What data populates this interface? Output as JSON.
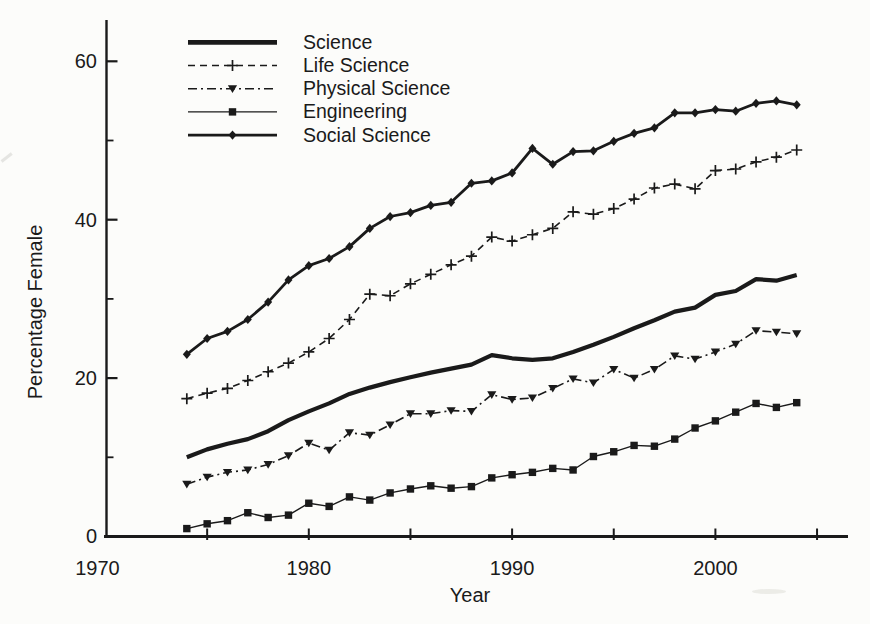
{
  "figure": {
    "background": "#fcfcfa",
    "ink_color": "#1a1a1a"
  },
  "chart_data": {
    "type": "line",
    "title": "",
    "xlabel": "Year",
    "ylabel": "Percentage Female",
    "x_range": [
      1970,
      2005
    ],
    "y_range": [
      0,
      65
    ],
    "x_major_ticks": [
      1970,
      1980,
      1990,
      2000
    ],
    "x_minor_ticks": [
      1975,
      1985,
      1995,
      2005
    ],
    "y_major_ticks": [
      0,
      20,
      40,
      60
    ],
    "y_minor_ticks": [
      10,
      30,
      50
    ],
    "grid": false,
    "legend_position": "upper-left-inside",
    "years": [
      1974,
      1975,
      1976,
      1977,
      1978,
      1979,
      1980,
      1981,
      1982,
      1983,
      1984,
      1985,
      1986,
      1987,
      1988,
      1989,
      1990,
      1991,
      1992,
      1993,
      1994,
      1995,
      1996,
      1997,
      1998,
      1999,
      2000,
      2001,
      2002,
      2003,
      2004
    ],
    "series": [
      {
        "name": "Science",
        "line": "solid-thick",
        "marker": "none",
        "values": [
          10,
          11,
          11.7,
          12.3,
          13.3,
          14.7,
          15.8,
          16.8,
          18,
          18.8,
          19.5,
          20.1,
          20.7,
          21.2,
          21.7,
          22.9,
          22.5,
          22.3,
          22.5,
          23.3,
          24.2,
          25.2,
          26.3,
          27.3,
          28.4,
          28.9,
          30.5,
          31,
          32.5,
          32.3,
          33
        ]
      },
      {
        "name": "Life Science",
        "line": "dashed",
        "marker": "plus",
        "values": [
          17.4,
          18.1,
          18.7,
          19.7,
          20.8,
          21.9,
          23.3,
          25,
          27.4,
          30.6,
          30.4,
          31.9,
          33.1,
          34.3,
          35.4,
          37.8,
          37.3,
          38.1,
          38.9,
          41,
          40.7,
          41.4,
          42.6,
          44,
          44.5,
          43.9,
          46.2,
          46.4,
          47.3,
          47.9,
          48.8
        ]
      },
      {
        "name": "Physical Science",
        "line": "dashdot",
        "marker": "triangle-down",
        "values": [
          6.6,
          7.5,
          8.1,
          8.4,
          9.1,
          10.2,
          11.8,
          10.9,
          13.1,
          12.8,
          14.1,
          15.5,
          15.5,
          15.9,
          15.8,
          17.9,
          17.3,
          17.5,
          18.7,
          19.9,
          19.4,
          21.1,
          20,
          21.1,
          22.8,
          22.4,
          23.3,
          24.3,
          26,
          25.8,
          25.6
        ]
      },
      {
        "name": "Engineering",
        "line": "solid-thin",
        "marker": "square",
        "values": [
          1,
          1.6,
          2,
          3,
          2.4,
          2.7,
          4.2,
          3.8,
          5,
          4.6,
          5.5,
          6,
          6.4,
          6.1,
          6.3,
          7.4,
          7.8,
          8.1,
          8.6,
          8.4,
          10.1,
          10.7,
          11.5,
          11.4,
          12.3,
          13.7,
          14.6,
          15.7,
          16.8,
          16.3,
          16.9
        ]
      },
      {
        "name": "Social Science",
        "line": "solid-medium",
        "marker": "diamond",
        "values": [
          23,
          25,
          25.9,
          27.4,
          29.6,
          32.4,
          34.2,
          35.1,
          36.6,
          38.9,
          40.4,
          40.9,
          41.8,
          42.2,
          44.6,
          44.9,
          45.9,
          49,
          47,
          48.6,
          48.7,
          49.9,
          50.9,
          51.6,
          53.5,
          53.5,
          53.9,
          53.7,
          54.7,
          55,
          54.5
        ]
      }
    ]
  }
}
